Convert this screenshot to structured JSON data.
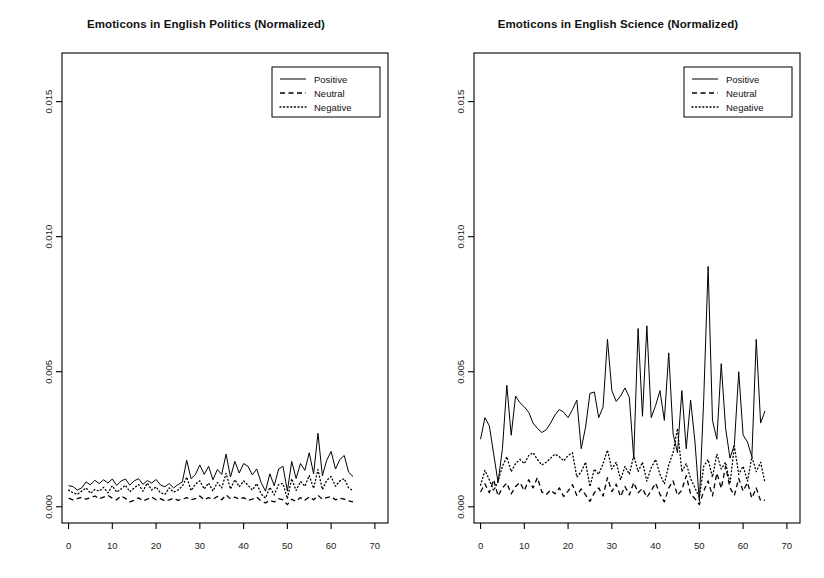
{
  "figure": {
    "width": 824,
    "height": 578,
    "background": "#ffffff",
    "foreground": "#000000",
    "panels": 2
  },
  "chart_data": [
    {
      "type": "line",
      "panel": "left",
      "title": "Emoticons in English Politics (Normalized)",
      "xlabel": "",
      "ylabel": "",
      "xlim": [
        -1.5,
        73.0
      ],
      "ylim": [
        -0.0006,
        0.0168
      ],
      "xticks": [
        0,
        10,
        20,
        30,
        40,
        50,
        60,
        70
      ],
      "xtick_labels": [
        "0",
        "10",
        "20",
        "30",
        "40",
        "50",
        "60",
        "70"
      ],
      "yticks": [
        0.0,
        0.005,
        0.01,
        0.015
      ],
      "ytick_labels": [
        "0.000",
        "0.005",
        "0.010",
        "0.015"
      ],
      "grid": false,
      "legend_position": "top-right",
      "x": [
        0,
        1,
        2,
        3,
        4,
        5,
        6,
        7,
        8,
        9,
        10,
        11,
        12,
        13,
        14,
        15,
        16,
        17,
        18,
        19,
        20,
        21,
        22,
        23,
        24,
        25,
        26,
        27,
        28,
        29,
        30,
        31,
        32,
        33,
        34,
        35,
        36,
        37,
        38,
        39,
        40,
        41,
        42,
        43,
        44,
        45,
        46,
        47,
        48,
        49,
        50,
        51,
        52,
        53,
        54,
        55,
        56,
        57,
        58,
        59,
        60,
        61,
        62,
        63,
        64,
        65
      ],
      "series": [
        {
          "name": "Positive",
          "style": "solid",
          "color": "#000000",
          "values": [
            0.00078,
            0.00075,
            0.00062,
            0.0007,
            0.00092,
            0.00081,
            0.00098,
            0.00086,
            0.001,
            0.00088,
            0.00103,
            0.00079,
            0.00095,
            0.00103,
            0.0008,
            0.00096,
            0.00104,
            0.00083,
            0.00097,
            0.00088,
            0.00101,
            0.00081,
            0.00074,
            0.00086,
            0.0007,
            0.00082,
            0.00092,
            0.00172,
            0.00104,
            0.0012,
            0.00155,
            0.0012,
            0.0015,
            0.001,
            0.00138,
            0.0012,
            0.00195,
            0.0011,
            0.00168,
            0.00125,
            0.0016,
            0.0015,
            0.00118,
            0.0014,
            0.0009,
            0.00058,
            0.00122,
            0.00078,
            0.0014,
            0.0015,
            0.00058,
            0.00168,
            0.00105,
            0.0016,
            0.00135,
            0.002,
            0.00122,
            0.00272,
            0.00115,
            0.00172,
            0.00205,
            0.0014,
            0.00175,
            0.0019,
            0.00128,
            0.00112
          ]
        },
        {
          "name": "Neutral",
          "style": "dashed",
          "color": "#000000",
          "values": [
            0.00032,
            0.00026,
            0.0003,
            0.00035,
            0.00028,
            0.00034,
            0.0004,
            0.0003,
            0.00036,
            0.00042,
            0.00032,
            0.00026,
            0.0004,
            0.00031,
            0.00018,
            0.00024,
            0.00033,
            0.00022,
            0.00028,
            0.00036,
            0.00026,
            0.0003,
            0.00022,
            0.00026,
            0.00032,
            0.00024,
            0.00028,
            0.00034,
            0.00026,
            0.0003,
            0.0004,
            0.00026,
            0.00034,
            0.00028,
            0.00038,
            0.00026,
            0.00044,
            0.0003,
            0.00036,
            0.00028,
            0.00034,
            0.00024,
            0.00028,
            0.00036,
            0.00022,
            0.00014,
            0.00024,
            0.00018,
            0.0003,
            0.00026,
            8e-05,
            0.00028,
            0.0002,
            0.00034,
            0.00024,
            0.00036,
            0.00026,
            0.00042,
            0.00028,
            0.00034,
            0.00038,
            0.00026,
            0.00032,
            0.00028,
            0.00022,
            0.00018
          ]
        },
        {
          "name": "Negative",
          "style": "dotted",
          "color": "#000000",
          "values": [
            0.00062,
            0.00052,
            0.00046,
            0.00058,
            0.0007,
            0.0005,
            0.00064,
            0.00058,
            0.00072,
            0.00052,
            0.00078,
            0.00054,
            0.00066,
            0.0008,
            0.00056,
            0.0007,
            0.00082,
            0.00058,
            0.00088,
            0.00062,
            0.00074,
            0.00052,
            0.00046,
            0.0007,
            0.00054,
            0.00062,
            0.00076,
            0.0011,
            0.0006,
            0.00084,
            0.00096,
            0.00066,
            0.00088,
            0.00058,
            0.0009,
            0.0007,
            0.00124,
            0.00066,
            0.001,
            0.00074,
            0.00096,
            0.0008,
            0.00062,
            0.00086,
            0.00048,
            0.00032,
            0.00072,
            0.00044,
            0.00082,
            0.00086,
            0.0003,
            0.00104,
            0.0006,
            0.00094,
            0.00076,
            0.00116,
            0.00068,
            0.00138,
            0.00064,
            0.00098,
            0.00112,
            0.00076,
            0.00096,
            0.00104,
            0.0007,
            0.0006
          ]
        }
      ]
    },
    {
      "type": "line",
      "panel": "right",
      "title": "Emoticons in English Science (Normalized)",
      "xlabel": "",
      "ylabel": "",
      "xlim": [
        -1.5,
        73.0
      ],
      "ylim": [
        -0.0006,
        0.0168
      ],
      "xticks": [
        0,
        10,
        20,
        30,
        40,
        50,
        60,
        70
      ],
      "xtick_labels": [
        "0",
        "10",
        "20",
        "30",
        "40",
        "50",
        "60",
        "70"
      ],
      "yticks": [
        0.0,
        0.005,
        0.01,
        0.015
      ],
      "ytick_labels": [
        "0.000",
        "0.005",
        "0.010",
        "0.015"
      ],
      "grid": false,
      "legend_position": "top-right",
      "x": [
        0,
        1,
        2,
        3,
        4,
        5,
        6,
        7,
        8,
        9,
        10,
        11,
        12,
        13,
        14,
        15,
        16,
        17,
        18,
        19,
        20,
        21,
        22,
        23,
        24,
        25,
        26,
        27,
        28,
        29,
        30,
        31,
        32,
        33,
        34,
        35,
        36,
        37,
        38,
        39,
        40,
        41,
        42,
        43,
        44,
        45,
        46,
        47,
        48,
        49,
        50,
        51,
        52,
        53,
        54,
        55,
        56,
        57,
        58,
        59,
        60,
        61,
        62,
        63,
        64,
        65
      ],
      "series": [
        {
          "name": "Positive",
          "style": "solid",
          "color": "#000000",
          "values": [
            0.0025,
            0.0033,
            0.003,
            0.00195,
            0.0009,
            0.00215,
            0.0045,
            0.00265,
            0.0041,
            0.00385,
            0.0037,
            0.0035,
            0.0031,
            0.0029,
            0.00275,
            0.00285,
            0.0031,
            0.0034,
            0.0036,
            0.0035,
            0.0033,
            0.0036,
            0.00395,
            0.00215,
            0.00295,
            0.0042,
            0.00425,
            0.0033,
            0.0037,
            0.0062,
            0.0043,
            0.0039,
            0.0041,
            0.0044,
            0.00405,
            0.0018,
            0.0066,
            0.00335,
            0.0067,
            0.0033,
            0.00375,
            0.0043,
            0.0032,
            0.0057,
            0.0027,
            0.002,
            0.0043,
            0.00215,
            0.00395,
            0.0024,
            0.0002,
            0.004,
            0.0089,
            0.0032,
            0.0025,
            0.0053,
            0.0029,
            0.0018,
            0.0023,
            0.005,
            0.00265,
            0.0024,
            0.00185,
            0.0062,
            0.0031,
            0.00355
          ]
        },
        {
          "name": "Neutral",
          "style": "dashed",
          "color": "#000000",
          "values": [
            0.00055,
            0.00085,
            0.00052,
            0.001,
            0.0004,
            0.0007,
            0.00088,
            0.00048,
            0.00075,
            0.0009,
            0.0006,
            0.001,
            0.0007,
            0.00108,
            0.00055,
            0.00045,
            0.00062,
            0.00048,
            0.0007,
            0.00038,
            0.00058,
            0.00082,
            0.00042,
            0.00066,
            0.00044,
            0.0002,
            0.00052,
            0.0007,
            0.0004,
            0.00108,
            0.00056,
            0.00084,
            0.00038,
            0.00075,
            0.00044,
            0.0009,
            0.00052,
            0.00068,
            0.00035,
            0.0006,
            0.00088,
            0.00046,
            0.00018,
            0.0007,
            0.00096,
            0.00042,
            0.00062,
            0.00115,
            0.00048,
            0.0003,
            8e-05,
            0.00058,
            0.00096,
            0.0004,
            0.00125,
            0.00068,
            0.0015,
            0.0007,
            0.00042,
            0.00105,
            0.00058,
            0.0009,
            0.00032,
            0.0007,
            0.00022,
            0.00025
          ]
        },
        {
          "name": "Negative",
          "style": "dotted",
          "color": "#000000",
          "values": [
            0.0008,
            0.00135,
            0.001,
            0.0006,
            0.00095,
            0.0015,
            0.00185,
            0.0013,
            0.0016,
            0.00175,
            0.0016,
            0.0019,
            0.002,
            0.00175,
            0.00155,
            0.00165,
            0.0018,
            0.00195,
            0.00185,
            0.0017,
            0.0019,
            0.002,
            0.0011,
            0.0013,
            0.00165,
            0.00075,
            0.0014,
            0.0012,
            0.0016,
            0.0021,
            0.0014,
            0.00165,
            0.001,
            0.0015,
            0.0012,
            0.0019,
            0.0013,
            0.00165,
            0.00095,
            0.00145,
            0.00175,
            0.0012,
            0.00085,
            0.00155,
            0.002,
            0.0029,
            0.0013,
            0.0016,
            0.00105,
            0.0007,
            0.00035,
            0.0015,
            0.00175,
            0.0011,
            0.00195,
            0.0014,
            0.00165,
            0.00085,
            0.00225,
            0.0012,
            0.0015,
            0.00095,
            0.00185,
            0.0013,
            0.00165,
            0.0009
          ]
        }
      ]
    }
  ],
  "legend": {
    "items": [
      {
        "label": "Positive",
        "style": "solid"
      },
      {
        "label": "Neutral",
        "style": "dashed"
      },
      {
        "label": "Negative",
        "style": "dotted"
      }
    ]
  }
}
